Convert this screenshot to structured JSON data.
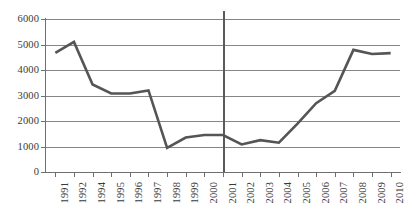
{
  "chart_data": {
    "type": "line",
    "title": "",
    "subtitle": "",
    "xlabel": "",
    "ylabel": "",
    "categories": [
      "1991",
      "1992",
      "1994",
      "1995",
      "1996",
      "1997",
      "1998",
      "1999",
      "2000",
      "2001",
      "2002",
      "2003",
      "2004",
      "2005",
      "2006",
      "2007",
      "2008",
      "2009",
      "2010"
    ],
    "values": [
      4670,
      5100,
      3430,
      3080,
      3080,
      3200,
      950,
      1350,
      1450,
      1450,
      1080,
      1250,
      1150,
      1900,
      2700,
      3180,
      4790,
      4630,
      4660
    ],
    "series": [
      {
        "name": "series-1",
        "values": [
          4670,
          5100,
          3430,
          3080,
          3080,
          3200,
          950,
          1350,
          1450,
          1450,
          1080,
          1250,
          1150,
          1900,
          2700,
          3180,
          4790,
          4630,
          4660
        ]
      }
    ],
    "ylim": [
      0,
      6000
    ],
    "yticks": [
      0,
      1000,
      2000,
      3000,
      4000,
      5000,
      6000
    ],
    "ytick_labels": [
      "0",
      "1000",
      "2000",
      "3000",
      "4000",
      "5000",
      "6000"
    ],
    "grid": true,
    "grid_axis": "y",
    "legend": false,
    "legend_position": "none",
    "annotations": [
      {
        "type": "vertical-reference-line",
        "at_category": "2001",
        "label": ""
      }
    ],
    "colors": {
      "series_line": "#555555",
      "gridline": "#868686",
      "axis": "#6f6f6f",
      "reference_line": "#5a5a5a",
      "tick_text": "#3a3a3a",
      "background": "#ffffff"
    }
  }
}
